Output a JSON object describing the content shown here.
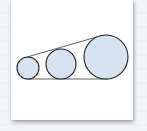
{
  "thumbnail": {
    "description": "Document page thumbnail showing three circles of increasing size tangent to a baseline and a sloped line",
    "colors": {
      "circle_fill": "#d8e3f1",
      "circle_stroke": "#1f1f1f",
      "line_stroke": "#3a3a3a",
      "paper": "#ffffff",
      "background": "#f3f4f6"
    },
    "circles": [
      {
        "name": "small",
        "cx": 28,
        "cy": 68,
        "r": 11
      },
      {
        "name": "medium",
        "cx": 61,
        "cy": 64,
        "r": 15
      },
      {
        "name": "large",
        "cx": 106,
        "cy": 57,
        "r": 22
      }
    ]
  }
}
